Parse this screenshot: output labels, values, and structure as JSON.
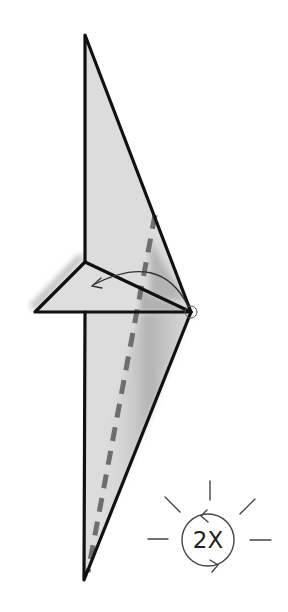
{
  "diagram": {
    "type": "origami-fold-step",
    "instruction_badge": {
      "label": "2X",
      "meaning": "repeat twice",
      "icon": "sun-repeat-icon"
    },
    "colors": {
      "paper_fill": "#dcdcdc",
      "outline": "#111111",
      "valley_fold_dash": "#6e6e6e",
      "arrow": "#333333",
      "shadow": "#8a8a8a",
      "background": "#ffffff"
    },
    "shapes": {
      "upper_flap": "85,35 191,312 85,262",
      "left_flap": "85,262 191,312 35,312",
      "lower_flap": "85,312 191,312 84,580"
    },
    "valley_fold_line": {
      "from": [
        155,
        215
      ],
      "to": [
        88,
        572
      ]
    },
    "fold_arrow": {
      "from": [
        190,
        310
      ],
      "to": [
        92,
        286
      ],
      "direction": "counter-clockwise"
    }
  }
}
